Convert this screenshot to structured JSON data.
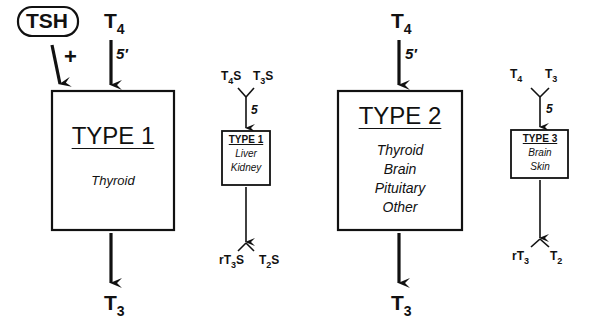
{
  "diagram": {
    "type": "deiodinase-pathways",
    "regulator": {
      "label": "TSH",
      "effect": "+"
    },
    "panels": [
      {
        "id": "type1-main",
        "input": {
          "base": "T",
          "sub": "4"
        },
        "position_label": "5′",
        "box": {
          "title": "TYPE 1",
          "tissues": [
            "Thyroid"
          ]
        },
        "output": {
          "base": "T",
          "sub": "3"
        }
      },
      {
        "id": "type1-sulfate",
        "inputs": [
          {
            "base": "T",
            "sub": "4",
            "suffix": "S"
          },
          {
            "base": "T",
            "sub": "3",
            "suffix": "S"
          }
        ],
        "position_label": "5",
        "box": {
          "title": "TYPE 1",
          "tissues": [
            "Liver",
            "Kidney"
          ]
        },
        "outputs": [
          {
            "prefix": "r",
            "base": "T",
            "sub": "3",
            "suffix": "S"
          },
          {
            "base": "T",
            "sub": "2",
            "suffix": "S"
          }
        ]
      },
      {
        "id": "type2",
        "input": {
          "base": "T",
          "sub": "4"
        },
        "position_label": "5′",
        "box": {
          "title": "TYPE 2",
          "tissues": [
            "Thyroid",
            "Brain",
            "Pituitary",
            "Other"
          ]
        },
        "output": {
          "base": "T",
          "sub": "3"
        }
      },
      {
        "id": "type3",
        "inputs": [
          {
            "base": "T",
            "sub": "4"
          },
          {
            "base": "T",
            "sub": "3"
          }
        ],
        "position_label": "5",
        "box": {
          "title": "TYPE 3",
          "tissues": [
            "Brain",
            "Skin"
          ]
        },
        "outputs": [
          {
            "prefix": "r",
            "base": "T",
            "sub": "3"
          },
          {
            "base": "T",
            "sub": "2"
          }
        ]
      }
    ]
  }
}
